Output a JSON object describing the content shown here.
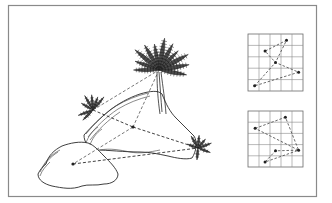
{
  "figure": {
    "colors": {
      "ink": "#222222",
      "frame": "#8a8a8a",
      "background": "#ffffff"
    }
  },
  "scene": {
    "ferns": [
      {
        "id": "tall-fern",
        "label": "tall fern on top of rock",
        "fronds": 11
      },
      {
        "id": "left-fern",
        "label": "small fern on left rock ledge",
        "fronds": 7
      },
      {
        "id": "right-fern",
        "label": "small fern at right base",
        "fronds": 7
      }
    ],
    "rocks": [
      {
        "id": "back-rock",
        "label": "large rear rock"
      },
      {
        "id": "front-rock",
        "label": "front left boulder"
      }
    ],
    "nodes": [
      {
        "id": "tall-fern-hub"
      },
      {
        "id": "left-fern-hub"
      },
      {
        "id": "right-fern-hub"
      },
      {
        "id": "center-point"
      },
      {
        "id": "front-rock-point"
      }
    ],
    "links": [
      [
        "left-fern-hub",
        "tall-fern-hub"
      ],
      [
        "left-fern-hub",
        "center-point"
      ],
      [
        "tall-fern-hub",
        "center-point"
      ],
      [
        "center-point",
        "right-fern-hub"
      ],
      [
        "center-point",
        "front-rock-point"
      ],
      [
        "front-rock-point",
        "right-fern-hub"
      ]
    ]
  },
  "grids": [
    {
      "id": "grid-top",
      "rows": 5,
      "cols": 5,
      "points": [
        [
          0.12,
          0.91
        ],
        [
          0.7,
          0.11
        ],
        [
          0.31,
          0.3
        ],
        [
          0.5,
          0.5
        ],
        [
          0.92,
          0.67
        ]
      ],
      "sequence": [
        0,
        3,
        1,
        2,
        3,
        4,
        0
      ]
    },
    {
      "id": "grid-bottom",
      "rows": 5,
      "cols": 5,
      "points": [
        [
          0.68,
          0.11
        ],
        [
          0.13,
          0.31
        ],
        [
          0.92,
          0.7
        ],
        [
          0.5,
          0.71
        ],
        [
          0.31,
          0.91
        ]
      ],
      "sequence": [
        1,
        0,
        2,
        3,
        4,
        2,
        1
      ]
    }
  ]
}
